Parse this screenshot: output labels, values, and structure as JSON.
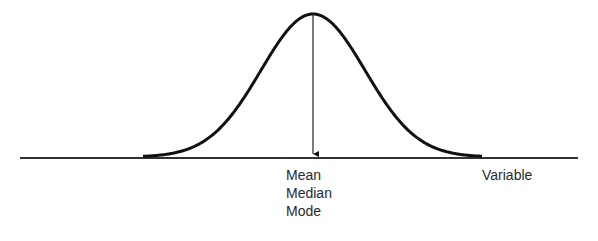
{
  "diagram": {
    "type": "normal-distribution",
    "center_labels": [
      "Mean",
      "Median",
      "Mode"
    ],
    "axis_label": "Variable",
    "colors": {
      "curve": "#111111",
      "axis": "#333333",
      "text": "#2a2a2a"
    }
  }
}
